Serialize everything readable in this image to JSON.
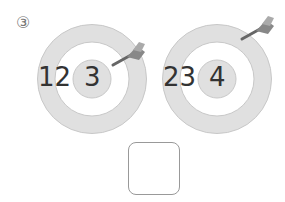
{
  "problem": {
    "label": "③",
    "targets": [
      {
        "outer_numbers": "12",
        "center_number": "3",
        "icon": "dart-icon"
      },
      {
        "outer_numbers": "23",
        "center_number": "4",
        "icon": "dart-icon"
      }
    ],
    "answer_box": {
      "value": ""
    }
  },
  "colors": {
    "ring": "#e0e0e0",
    "ring_stroke": "#c8c8c8",
    "bullseye": "#e0e0e0",
    "text": "#333333",
    "dart": "#777777"
  }
}
